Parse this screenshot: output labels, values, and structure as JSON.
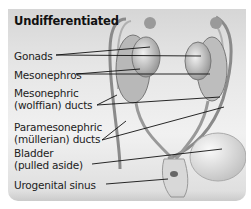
{
  "diagram": {
    "title": "Undifferentiated",
    "labels": [
      {
        "id": "gonads",
        "line1": "Gonads",
        "line2": ""
      },
      {
        "id": "mesonephros",
        "line1": "Mesonephros",
        "line2": ""
      },
      {
        "id": "mesonephric-ducts",
        "line1": "Mesonephric",
        "line2": "(wolffian) ducts"
      },
      {
        "id": "paramesonephric-ducts",
        "line1": "Paramesonephric",
        "line2": "(müllerian) ducts"
      },
      {
        "id": "bladder",
        "line1": "Bladder",
        "line2": "(pulled aside)"
      },
      {
        "id": "urogenital-sinus",
        "line1": "Urogenital sinus",
        "line2": ""
      }
    ],
    "colors": {
      "panel_top": "#d6d6d6",
      "panel_bottom": "#f1f1f1",
      "text": "#222222",
      "leader_line": "#111111"
    }
  }
}
